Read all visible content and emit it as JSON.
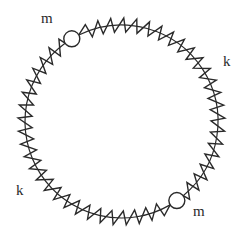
{
  "diagram": {
    "title": "",
    "ring": {
      "cx": 121.5,
      "cy": 121.5,
      "r": 96.5,
      "amplitude": 14,
      "stroke": "#2a2a2a"
    },
    "masses": [
      {
        "id": "m1",
        "label": "m",
        "angle_deg": -121,
        "radius": 8,
        "label_pos": {
          "x": 41,
          "y": 11
        }
      },
      {
        "id": "m2",
        "label": "m",
        "angle_deg": 55,
        "radius": 8,
        "label_pos": {
          "x": 193,
          "y": 204
        }
      }
    ],
    "springs": [
      {
        "id": "k1",
        "label": "k",
        "from_deg": -121,
        "to_deg": 55,
        "coils": 23,
        "label_pos": {
          "x": 223,
          "y": 54
        }
      },
      {
        "id": "k2",
        "label": "k",
        "from_deg": 55,
        "to_deg": 239,
        "coils": 24,
        "label_pos": {
          "x": 16,
          "y": 183
        }
      }
    ]
  }
}
